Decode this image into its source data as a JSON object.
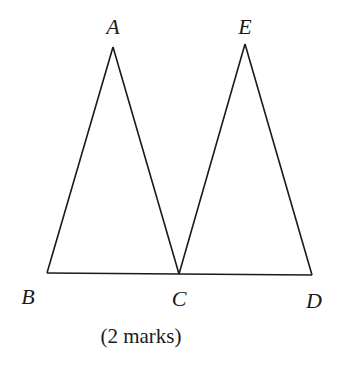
{
  "diagram": {
    "type": "geometry-figure",
    "points": [
      {
        "id": "A",
        "label": "A"
      },
      {
        "id": "B",
        "label": "B"
      },
      {
        "id": "C",
        "label": "C"
      },
      {
        "id": "D",
        "label": "D"
      },
      {
        "id": "E",
        "label": "E"
      }
    ],
    "segments": [
      [
        "A",
        "B"
      ],
      [
        "A",
        "C"
      ],
      [
        "E",
        "C"
      ],
      [
        "E",
        "D"
      ],
      [
        "B",
        "C"
      ],
      [
        "C",
        "D"
      ]
    ]
  },
  "caption": "(2 marks)"
}
